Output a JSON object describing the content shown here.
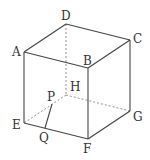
{
  "diagram": {
    "type": "cube",
    "vertices": {
      "A": {
        "x": 24,
        "y": 52
      },
      "B": {
        "x": 88,
        "y": 68
      },
      "C": {
        "x": 130,
        "y": 40
      },
      "D": {
        "x": 66,
        "y": 24
      },
      "E": {
        "x": 24,
        "y": 123
      },
      "F": {
        "x": 88,
        "y": 139
      },
      "G": {
        "x": 130,
        "y": 111
      },
      "H": {
        "x": 66,
        "y": 95
      },
      "P": {
        "x": 52,
        "y": 104
      },
      "Q": {
        "x": 45,
        "y": 128
      }
    },
    "labels": {
      "A": "A",
      "B": "B",
      "C": "C",
      "D": "D",
      "E": "E",
      "F": "F",
      "G": "G",
      "H": "H",
      "P": "P",
      "Q": "Q"
    },
    "solid_edges": [
      [
        "A",
        "B"
      ],
      [
        "B",
        "C"
      ],
      [
        "C",
        "D"
      ],
      [
        "D",
        "A"
      ],
      [
        "A",
        "E"
      ],
      [
        "B",
        "F"
      ],
      [
        "C",
        "G"
      ],
      [
        "E",
        "F"
      ],
      [
        "F",
        "G"
      ],
      [
        "P",
        "Q"
      ]
    ],
    "dashed_edges": [
      [
        "D",
        "H"
      ],
      [
        "H",
        "E"
      ],
      [
        "H",
        "G"
      ]
    ],
    "colors": {
      "line": "#444444",
      "dashed": "#888888",
      "text": "#333333"
    }
  }
}
